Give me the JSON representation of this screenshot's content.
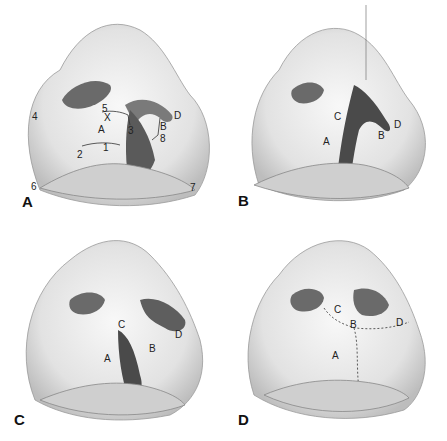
{
  "figure": {
    "panels": [
      {
        "id": "A",
        "letter": "A",
        "labels": {
          "flapA": "A",
          "flapB": "B",
          "flapD": "D",
          "x": "X",
          "p1": "1",
          "p2": "2",
          "p3": "3",
          "p4": "4",
          "p5": "5",
          "p6": "6",
          "p7": "7",
          "p8": "8"
        }
      },
      {
        "id": "B",
        "letter": "B",
        "labels": {
          "flapA": "A",
          "flapB": "B",
          "flapC": "C",
          "flapD": "D"
        }
      },
      {
        "id": "C",
        "letter": "C",
        "labels": {
          "flapA": "A",
          "flapB": "B",
          "flapC": "C",
          "flapD": "D"
        }
      },
      {
        "id": "D",
        "letter": "D",
        "labels": {
          "flapA": "A",
          "flapB": "B",
          "flapC": "C",
          "flapD": "D"
        }
      }
    ]
  },
  "colors": {
    "background": "#ffffff",
    "skin_light": "#f2f2f2",
    "skin_mid": "#d6d6d6",
    "shadow": "#8a8a8a",
    "nostril": "#5a5a5a",
    "cleft_dark": "#4a4a4a",
    "line": "#333333"
  }
}
